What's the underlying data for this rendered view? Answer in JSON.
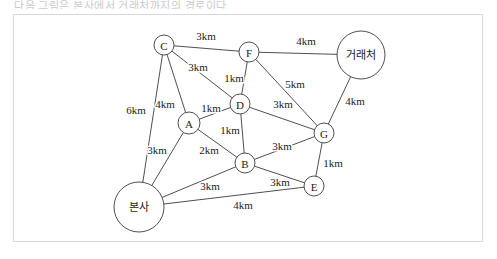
{
  "caption": {
    "text": "다음 그림은 본사에서 거래처까지의 경로이다."
  },
  "diagram": {
    "type": "undirected-weighted-graph",
    "unit": "km",
    "nodes": [
      {
        "id": "C",
        "label": "C",
        "x": 164,
        "y": 45,
        "r": 10,
        "script": "latin"
      },
      {
        "id": "F",
        "label": "F",
        "x": 249,
        "y": 52,
        "r": 10,
        "script": "latin"
      },
      {
        "id": "DEST",
        "label": "거래처",
        "x": 361,
        "y": 55,
        "r": 24,
        "script": "korean"
      },
      {
        "id": "D",
        "label": "D",
        "x": 240,
        "y": 104,
        "r": 10,
        "script": "latin"
      },
      {
        "id": "A",
        "label": "A",
        "x": 189,
        "y": 123,
        "r": 11,
        "script": "latin"
      },
      {
        "id": "G",
        "label": "G",
        "x": 324,
        "y": 133,
        "r": 10,
        "script": "latin"
      },
      {
        "id": "B",
        "label": "B",
        "x": 245,
        "y": 163,
        "r": 10,
        "script": "latin"
      },
      {
        "id": "E",
        "label": "E",
        "x": 314,
        "y": 186,
        "r": 10,
        "script": "latin"
      },
      {
        "id": "HQ",
        "label": "본사",
        "x": 139,
        "y": 207,
        "r": 25,
        "script": "korean"
      }
    ],
    "edges": [
      {
        "from": "C",
        "to": "F",
        "weight": "3km",
        "lx": 206,
        "ly": 36
      },
      {
        "from": "F",
        "to": "DEST",
        "weight": "4km",
        "lx": 306,
        "ly": 41
      },
      {
        "from": "C",
        "to": "D",
        "weight": "3km",
        "lx": 198,
        "ly": 67
      },
      {
        "from": "F",
        "to": "D",
        "weight": "1km",
        "lx": 234,
        "ly": 78
      },
      {
        "from": "F",
        "to": "G",
        "weight": "5km",
        "lx": 295,
        "ly": 84
      },
      {
        "from": "DEST",
        "to": "G",
        "weight": "4km",
        "lx": 355,
        "ly": 101
      },
      {
        "from": "D",
        "to": "G",
        "weight": "3km",
        "lx": 283,
        "ly": 104
      },
      {
        "from": "C",
        "to": "A",
        "weight": "4km",
        "lx": 165,
        "ly": 104
      },
      {
        "from": "C",
        "to": "HQ",
        "weight": "6km",
        "lx": 136,
        "ly": 110
      },
      {
        "from": "A",
        "to": "D",
        "weight": "1km",
        "lx": 211,
        "ly": 108
      },
      {
        "from": "D",
        "to": "B",
        "weight": "1km",
        "lx": 230,
        "ly": 130
      },
      {
        "from": "A",
        "to": "B",
        "weight": "2km",
        "lx": 209,
        "ly": 150
      },
      {
        "from": "A",
        "to": "HQ",
        "weight": "3km",
        "lx": 157,
        "ly": 150
      },
      {
        "from": "B",
        "to": "G",
        "weight": "3km",
        "lx": 282,
        "ly": 146
      },
      {
        "from": "G",
        "to": "E",
        "weight": "1km",
        "lx": 333,
        "ly": 163
      },
      {
        "from": "B",
        "to": "E",
        "weight": "3km",
        "lx": 280,
        "ly": 182
      },
      {
        "from": "HQ",
        "to": "B",
        "weight": "3km",
        "lx": 210,
        "ly": 186
      },
      {
        "from": "HQ",
        "to": "E",
        "weight": "4km",
        "lx": 243,
        "ly": 205
      }
    ]
  }
}
